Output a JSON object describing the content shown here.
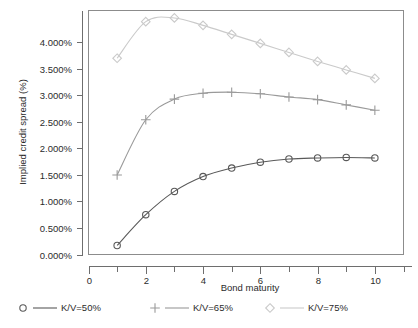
{
  "chart_data": {
    "type": "line",
    "title": "",
    "xlabel": "Bond maturity",
    "ylabel": "Implied credit spread (%)",
    "x": [
      1,
      2,
      3,
      4,
      5,
      6,
      7,
      8,
      9,
      10
    ],
    "xlim": [
      0,
      11
    ],
    "ylim": [
      0.0,
      4.6
    ],
    "xticks": [
      0,
      2,
      4,
      6,
      8,
      10
    ],
    "xtick_labels": [
      "0",
      "2",
      "4",
      "6",
      "8",
      "10"
    ],
    "xminor_ticks": [
      1,
      3,
      5,
      7,
      9,
      11
    ],
    "yticks": [
      0.0,
      0.5,
      1.0,
      1.5,
      2.0,
      2.5,
      3.0,
      3.5,
      4.0
    ],
    "ytick_labels": [
      "0.000%",
      "0.500%",
      "1.000%",
      "1.500%",
      "2.000%",
      "2.500%",
      "3.000%",
      "3.500%",
      "4.000%"
    ],
    "grid": false,
    "legend_position": "below",
    "series": [
      {
        "name": "K/V=50%",
        "marker": "circle",
        "color": "#595959",
        "values": [
          0.17,
          0.75,
          1.19,
          1.47,
          1.63,
          1.74,
          1.8,
          1.82,
          1.83,
          1.82
        ]
      },
      {
        "name": "K/V=65%",
        "marker": "plus",
        "color": "#9a9a9a",
        "values": [
          1.5,
          2.54,
          2.93,
          3.04,
          3.06,
          3.03,
          2.97,
          2.92,
          2.82,
          2.72
        ]
      },
      {
        "name": "K/V=75%",
        "marker": "diamond",
        "color": "#cacaca",
        "values": [
          3.7,
          4.39,
          4.46,
          4.32,
          4.15,
          3.98,
          3.81,
          3.64,
          3.48,
          3.32
        ]
      }
    ]
  },
  "legend": {
    "entries": [
      {
        "label": "K/V=50%",
        "marker": "circle-marker-icon",
        "color": "#595959"
      },
      {
        "label": "K/V=65%",
        "marker": "plus-marker-icon",
        "color": "#9a9a9a"
      },
      {
        "label": "K/V=75%",
        "marker": "diamond-marker-icon",
        "color": "#cacaca"
      }
    ]
  },
  "axes": {
    "x_title": "Bond maturity",
    "y_title": "Implied credit spread (%)"
  }
}
